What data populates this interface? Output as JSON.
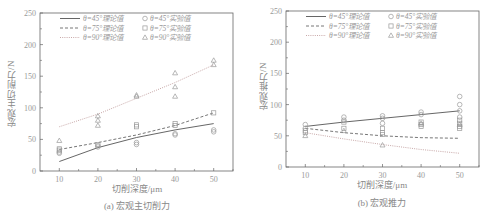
{
  "chart_data": [
    {
      "type": "line",
      "title": "",
      "caption": "(a) 宏观主切削力",
      "xlabel": "切削深度/μm",
      "ylabel": "宏观主切削力/N",
      "xlim": [
        5,
        55
      ],
      "ylim": [
        0,
        250
      ],
      "xticks": [
        10,
        20,
        30,
        40,
        50
      ],
      "yticks": [
        0,
        50,
        100,
        150,
        200,
        250
      ],
      "grid": false,
      "legend_position": "upper",
      "x": [
        10,
        20,
        30,
        40,
        50
      ],
      "series": [
        {
          "name": "θ=45°理论值",
          "kind": "theory",
          "style": "solid",
          "values": [
            15,
            37,
            53,
            65,
            75
          ]
        },
        {
          "name": "θ=75°理论值",
          "kind": "theory",
          "style": "dashed",
          "values": [
            34,
            45,
            57,
            72,
            92
          ]
        },
        {
          "name": "θ=90°理论值",
          "kind": "theory",
          "style": "dotted",
          "values": [
            70,
            90,
            115,
            140,
            168
          ]
        },
        {
          "name": "θ=45°实验值",
          "kind": "experiment",
          "marker": "circle",
          "points": [
            [
              10,
              28
            ],
            [
              10,
              30
            ],
            [
              20,
              38
            ],
            [
              20,
              40
            ],
            [
              30,
              42
            ],
            [
              30,
              45
            ],
            [
              40,
              57
            ],
            [
              40,
              59
            ],
            [
              50,
              62
            ],
            [
              50,
              65
            ]
          ]
        },
        {
          "name": "θ=75°实验值",
          "kind": "experiment",
          "marker": "square",
          "points": [
            [
              10,
              33
            ],
            [
              10,
              35
            ],
            [
              20,
              42
            ],
            [
              30,
              70
            ],
            [
              30,
              73
            ],
            [
              40,
              72
            ],
            [
              40,
              75
            ],
            [
              50,
              92
            ]
          ]
        },
        {
          "name": "θ=90°实验值",
          "kind": "experiment",
          "marker": "triangle",
          "points": [
            [
              10,
              48
            ],
            [
              20,
              72
            ],
            [
              20,
              80
            ],
            [
              20,
              87
            ],
            [
              30,
              118
            ],
            [
              30,
              120
            ],
            [
              40,
              118
            ],
            [
              40,
              133
            ],
            [
              40,
              155
            ],
            [
              50,
              168
            ],
            [
              50,
              175
            ]
          ]
        }
      ]
    },
    {
      "type": "line",
      "title": "",
      "caption": "(b) 宏观推力",
      "xlabel": "切削深度/μm",
      "ylabel": "宏观推力/N",
      "xlim": [
        5,
        55
      ],
      "ylim": [
        0,
        250
      ],
      "xticks": [
        10,
        20,
        30,
        40,
        50
      ],
      "yticks": [
        0,
        50,
        100,
        150,
        200,
        250
      ],
      "grid": false,
      "legend_position": "upper",
      "x": [
        10,
        20,
        30,
        40,
        50
      ],
      "series": [
        {
          "name": "θ=45°理论值",
          "kind": "theory",
          "style": "solid",
          "values": [
            65,
            72,
            78,
            84,
            90
          ]
        },
        {
          "name": "θ=75°理论值",
          "kind": "theory",
          "style": "dashed",
          "values": [
            62,
            55,
            50,
            47,
            46
          ]
        },
        {
          "name": "θ=90°理论值",
          "kind": "theory",
          "style": "dotted",
          "values": [
            55,
            45,
            36,
            28,
            22
          ]
        },
        {
          "name": "θ=45°实验值",
          "kind": "experiment",
          "marker": "circle",
          "points": [
            [
              10,
              68
            ],
            [
              10,
              62
            ],
            [
              20,
              80
            ],
            [
              20,
              75
            ],
            [
              30,
              82
            ],
            [
              30,
              78
            ],
            [
              30,
              70
            ],
            [
              40,
              88
            ],
            [
              40,
              84
            ],
            [
              50,
              113
            ],
            [
              50,
              100
            ],
            [
              50,
              90
            ],
            [
              50,
              80
            ]
          ]
        },
        {
          "name": "θ=75°实验值",
          "kind": "experiment",
          "marker": "square",
          "points": [
            [
              10,
              58
            ],
            [
              10,
              55
            ],
            [
              20,
              72
            ],
            [
              20,
              62
            ],
            [
              30,
              62
            ],
            [
              30,
              55
            ],
            [
              30,
              52
            ],
            [
              40,
              72
            ],
            [
              40,
              68
            ],
            [
              40,
              65
            ],
            [
              50,
              75
            ],
            [
              50,
              70
            ],
            [
              50,
              65
            ],
            [
              50,
              62
            ]
          ]
        },
        {
          "name": "θ=90°实验值",
          "kind": "experiment",
          "marker": "triangle",
          "points": [
            [
              10,
              50
            ],
            [
              20,
              58
            ],
            [
              30,
              35
            ],
            [
              40,
              70
            ],
            [
              50,
              68
            ]
          ]
        }
      ]
    }
  ],
  "panels": {
    "a": {
      "ylabel": "宏观主切削力/N",
      "xlabel": "切削深度/μm",
      "caption": "(a) 宏观主切削力"
    },
    "b": {
      "ylabel": "宏观推力/N",
      "xlabel": "切削深度/μm",
      "caption": "(b) 宏观推力"
    }
  },
  "legend": {
    "theory": [
      "θ=45°理论值",
      "θ=75°理论值",
      "θ=90°理论值"
    ],
    "experiment": [
      "θ=45°实验值",
      "θ=75°实验值",
      "θ=90°实验值"
    ]
  },
  "colors": {
    "axis": "#666666",
    "theory45": "#555555",
    "theory75": "#666666",
    "theory90": "#c8a8a8",
    "marker": "#999999",
    "text": "#999999"
  }
}
